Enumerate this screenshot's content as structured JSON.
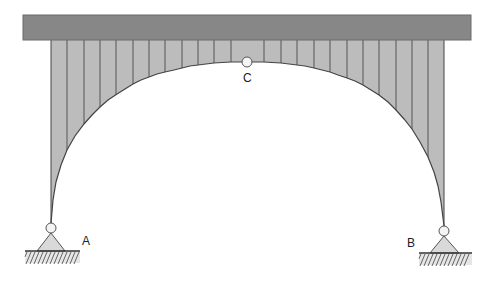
{
  "diagram": {
    "canvas": {
      "width": 497,
      "height": 282
    },
    "colors": {
      "deck_fill": "#878787",
      "deck_stroke": "#6a6a6a",
      "infill": "#bcbcbc",
      "hanger": "#555555",
      "arch_stroke": "#444444",
      "hinge_fill": "#f4f4f4",
      "hinge_stroke": "#555555",
      "support_fill": "#d9d9d9",
      "support_stroke": "#555555",
      "ground_line": "#333333",
      "hatch": "#555555"
    },
    "deck": {
      "x": 23,
      "y": 15,
      "width": 448,
      "height": 25
    },
    "arch": {
      "left_x": 51,
      "right_x": 444,
      "crown_x": 247,
      "crown_y": 62,
      "left_spring_y": 223,
      "right_spring_y": 226,
      "points": [
        [
          51,
          223
        ],
        [
          53,
          200
        ],
        [
          56,
          182
        ],
        [
          61,
          165
        ],
        [
          67,
          150
        ],
        [
          75,
          136
        ],
        [
          84,
          124
        ],
        [
          92,
          115
        ],
        [
          100,
          107
        ],
        [
          108,
          100
        ],
        [
          117,
          94
        ],
        [
          125,
          89
        ],
        [
          133,
          84
        ],
        [
          141,
          80
        ],
        [
          149,
          77
        ],
        [
          157,
          74
        ],
        [
          165,
          72
        ],
        [
          174,
          70
        ],
        [
          182,
          68
        ],
        [
          190,
          66
        ],
        [
          198,
          65
        ],
        [
          206,
          64
        ],
        [
          214,
          63
        ],
        [
          222,
          62.5
        ],
        [
          231,
          62
        ],
        [
          239,
          62
        ],
        [
          247,
          62
        ],
        [
          255,
          62
        ],
        [
          264,
          62
        ],
        [
          272,
          62.5
        ],
        [
          281,
          63
        ],
        [
          289,
          64
        ],
        [
          297,
          65
        ],
        [
          305,
          66
        ],
        [
          314,
          68
        ],
        [
          322,
          70
        ],
        [
          330,
          72
        ],
        [
          338,
          75
        ],
        [
          347,
          78
        ],
        [
          355,
          81
        ],
        [
          363,
          85
        ],
        [
          371,
          90
        ],
        [
          379,
          95
        ],
        [
          388,
          102
        ],
        [
          396,
          110
        ],
        [
          404,
          119
        ],
        [
          412,
          129
        ],
        [
          420,
          142
        ],
        [
          428,
          157
        ],
        [
          434,
          172
        ],
        [
          438,
          186
        ],
        [
          441,
          202
        ],
        [
          444,
          226
        ]
      ]
    },
    "hangers_x": [
      67,
      84,
      100,
      116,
      133,
      149,
      165,
      182,
      198,
      214,
      231,
      264,
      281,
      297,
      314,
      330,
      347,
      363,
      379,
      396,
      412,
      428
    ],
    "hinges": [
      {
        "id": "A",
        "label": "A",
        "cx": 51,
        "cy": 228,
        "r": 5,
        "label_x": 82,
        "label_y": 245
      },
      {
        "id": "C",
        "label": "C",
        "cx": 247,
        "cy": 62,
        "r": 5,
        "label_x": 243,
        "label_y": 82
      },
      {
        "id": "B",
        "label": "B",
        "cx": 444,
        "cy": 231,
        "r": 5,
        "label_x": 407,
        "label_y": 247
      }
    ],
    "supports": [
      {
        "id": "A",
        "apex_x": 51,
        "apex_y": 233,
        "base_left": 37,
        "base_right": 65,
        "base_y": 251,
        "ground_x1": 25,
        "ground_x2": 80,
        "ground_y": 251,
        "hatch_depth": 12
      },
      {
        "id": "B",
        "apex_x": 444,
        "apex_y": 236,
        "base_left": 430,
        "base_right": 459,
        "base_y": 253,
        "ground_x1": 419,
        "ground_x2": 472,
        "ground_y": 253,
        "hatch_depth": 12
      }
    ],
    "labels": {
      "A": "A",
      "B": "B",
      "C": "C"
    }
  }
}
